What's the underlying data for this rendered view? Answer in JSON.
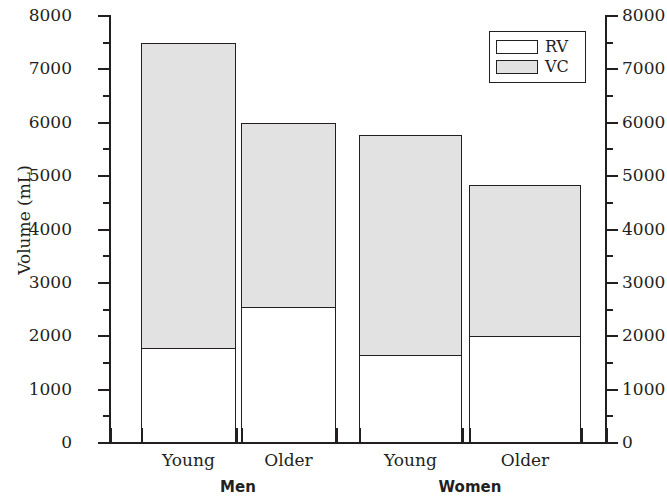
{
  "chart_data": {
    "type": "bar",
    "subtype": "stacked-bar",
    "title": "",
    "xlabel": "",
    "ylabel": "Volume (mL)",
    "ylim": [
      0,
      8000
    ],
    "ytick_step": 1000,
    "yminor_step": 500,
    "grid": false,
    "dual_y_axis": true,
    "legend_position": "top-right",
    "categories": [
      "Young",
      "Older",
      "Young",
      "Older"
    ],
    "groups": [
      {
        "name": "Men",
        "categories": [
          "Young",
          "Older"
        ]
      },
      {
        "name": "Women",
        "categories": [
          "Young",
          "Older"
        ]
      }
    ],
    "series": [
      {
        "name": "RV",
        "color": "#ffffff",
        "values": [
          1775,
          2550,
          1650,
          2000
        ]
      },
      {
        "name": "VC",
        "color": "#e2e2e2",
        "values": [
          5725,
          3450,
          4125,
          2825
        ]
      }
    ],
    "totals": [
      7500,
      6000,
      5775,
      4825
    ],
    "ytick_labels": [
      "0",
      "1000",
      "2000",
      "3000",
      "4000",
      "5000",
      "6000",
      "7000",
      "8000"
    ],
    "ytick_values": [
      0,
      1000,
      2000,
      3000,
      4000,
      5000,
      6000,
      7000,
      8000
    ],
    "yminor_values": [
      500,
      1500,
      2500,
      3500,
      4500,
      5500,
      6500,
      7500
    ],
    "legend": [
      {
        "label": "RV",
        "fill": "#ffffff"
      },
      {
        "label": "VC",
        "fill": "#e2e2e2"
      }
    ],
    "axis_color": "#231f20",
    "background": "#ffffff",
    "bars": [
      {
        "group": "Men",
        "category": "Young",
        "rv": 1775,
        "total": 7500,
        "x": 141,
        "width": 95
      },
      {
        "group": "Men",
        "category": "Older",
        "rv": 2550,
        "total": 6000,
        "x": 241,
        "width": 95
      },
      {
        "group": "Women",
        "category": "Young",
        "rv": 1650,
        "total": 5775,
        "x": 359,
        "width": 103
      },
      {
        "group": "Women",
        "category": "Older",
        "rv": 2000,
        "total": 4825,
        "x": 469,
        "width": 112
      }
    ]
  },
  "axis": {
    "y_title": "Volume (mL)"
  },
  "group_labels": {
    "men": "Men",
    "women": "Women"
  }
}
